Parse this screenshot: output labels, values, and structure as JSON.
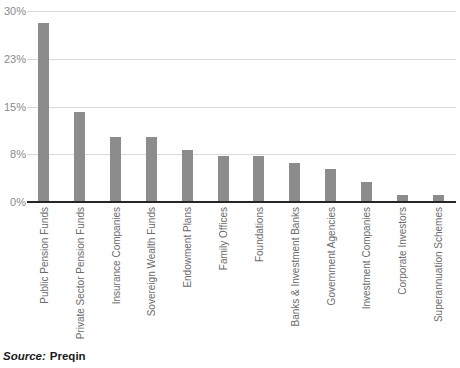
{
  "chart_data": {
    "type": "bar",
    "title": "",
    "xlabel": "",
    "ylabel": "",
    "categories": [
      "Public Pension Funds",
      "Private Sector Pension Funds",
      "Insurance Companies",
      "Sovereign Wealth Funds",
      "Endowment Plans",
      "Family Offices",
      "Foundations",
      "Banks & Investment Banks",
      "Government Agencies",
      "Investment Companies",
      "Corporate Investors",
      "Superannuation Schemes"
    ],
    "values": [
      28,
      14,
      10,
      10,
      8,
      7,
      7,
      6,
      5,
      3,
      1,
      1
    ],
    "ylim": [
      0,
      30
    ],
    "yticks": [
      {
        "value": 0,
        "label": "0%"
      },
      {
        "value": 7.5,
        "label": "8%"
      },
      {
        "value": 15,
        "label": "15%"
      },
      {
        "value": 22.5,
        "label": "23%"
      },
      {
        "value": 30,
        "label": "30%"
      }
    ],
    "grid": true,
    "legend": false,
    "bar_color": "#8c8c8c",
    "colors": {
      "gridline": "#d9d9d9",
      "axis_line": "#262626",
      "ytick_label": "#8a8a8a",
      "xtick_label": "#6b6b6b",
      "source_text": "#1a1a1a"
    }
  },
  "source": {
    "prefix": "Source:",
    "name": "Preqin"
  }
}
